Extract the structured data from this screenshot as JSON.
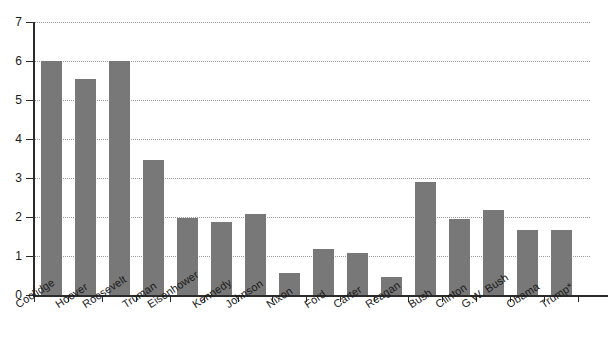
{
  "chart_data": {
    "type": "bar",
    "title": "",
    "subtitle": "",
    "xlabel": "",
    "ylabel": "",
    "ylim": [
      0,
      7
    ],
    "ytick_labels": [
      "0",
      "1",
      "2",
      "3",
      "4",
      "5",
      "6",
      "7"
    ],
    "ytick_values": [
      0,
      1,
      2,
      3,
      4,
      5,
      6,
      7
    ],
    "grid": true,
    "grid_axis": "y",
    "legend": false,
    "legend_position": "none",
    "bar_color": "#787878",
    "axis_color": "#2b2b2b",
    "gridline_color": "#9a9a9a",
    "categories": [
      "Coolidge",
      "Hoover",
      "Roosevelt",
      "Truman",
      "Eisenhower",
      "Kennedy",
      "Johnson",
      "Nixon",
      "Ford",
      "Carter",
      "Reagan",
      "Bush",
      "Clinton",
      "G.W. Bush",
      "Obama",
      "Trump*"
    ],
    "values": [
      6.0,
      5.55,
      6.0,
      3.47,
      1.97,
      1.88,
      2.09,
      0.56,
      1.18,
      1.09,
      0.47,
      2.89,
      1.96,
      2.17,
      1.67,
      1.67
    ],
    "footnote_marker": "*"
  }
}
